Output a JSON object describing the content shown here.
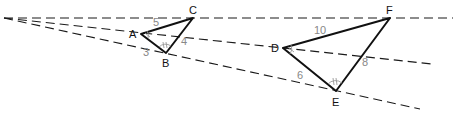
{
  "diagram": {
    "colors": {
      "rays": "#1a1a1a",
      "triangle_edges": "#111111",
      "vertex_labels": "#111111",
      "side_labels": "#888888",
      "angle_marks": "#999999"
    },
    "center": {
      "x": 4,
      "y": 18
    },
    "rays": [
      {
        "name": "ray-through-C-F",
        "x2": 453,
        "y2": 18
      },
      {
        "name": "ray-through-A-D",
        "x2": 432,
        "y2": 64
      },
      {
        "name": "ray-through-B-E",
        "x2": 420,
        "y2": 109
      }
    ],
    "small_triangle": {
      "vertices": {
        "A": {
          "label": "A",
          "x": 141,
          "y": 34
        },
        "B": {
          "label": "B",
          "x": 166,
          "y": 53
        },
        "C": {
          "label": "C",
          "x": 193,
          "y": 18
        }
      },
      "sides": {
        "AC": "5",
        "BC": "4",
        "AB": "3"
      }
    },
    "large_triangle": {
      "vertices": {
        "D": {
          "label": "D",
          "x": 283,
          "y": 48
        },
        "E": {
          "label": "E",
          "x": 336,
          "y": 91
        },
        "F": {
          "label": "F",
          "x": 390,
          "y": 18
        }
      },
      "sides": {
        "DF": "10",
        "EF": "8",
        "DE": "6"
      }
    }
  }
}
